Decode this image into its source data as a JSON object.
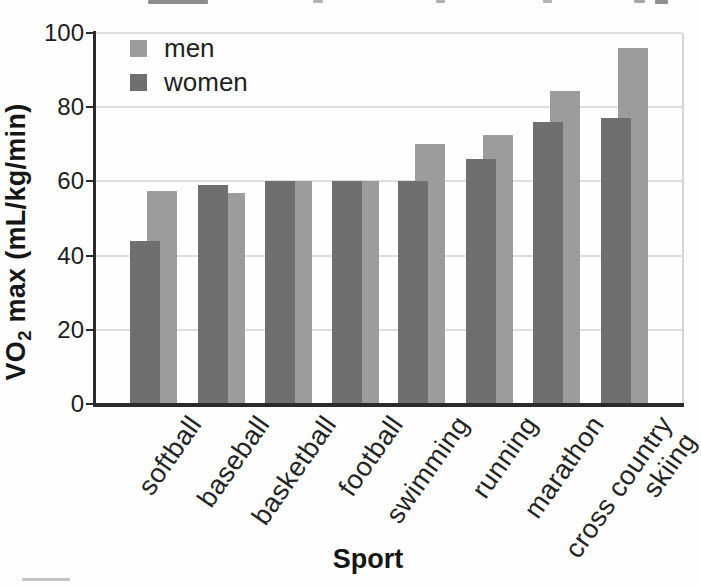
{
  "chart_data": {
    "type": "bar",
    "title": "",
    "xlabel": "Sport",
    "ylabel": "VO2 max (mL/kg/min)",
    "ylabel_parts": {
      "pre": "VO",
      "sub": "2",
      "post": " max (mL/kg/min)"
    },
    "categories": [
      "softball",
      "baseball",
      "basketball",
      "football",
      "swimming",
      "running",
      "marathon",
      "cross country skiing"
    ],
    "xtick_display": [
      "softball",
      "baseball",
      "basketball",
      "football",
      "swimming",
      "running",
      "marathon",
      "cross country\nskiing"
    ],
    "series": [
      {
        "name": "men",
        "color": "#9c9c9a",
        "values": [
          57.5,
          57,
          60,
          60,
          70,
          72.5,
          84.5,
          96
        ]
      },
      {
        "name": "women",
        "color": "#6f6f71",
        "values": [
          44,
          59,
          60,
          60,
          60,
          66,
          76,
          77
        ]
      }
    ],
    "ylim": [
      0,
      100
    ],
    "yticks": [
      0,
      20,
      40,
      60,
      80,
      100
    ],
    "grid": true,
    "legend_position": "top-left"
  }
}
